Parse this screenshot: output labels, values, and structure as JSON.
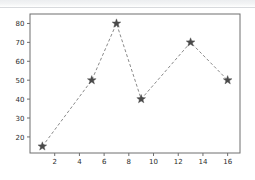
{
  "figure": {
    "background_color": "#ffffff",
    "top_band_color": "#eceef0",
    "axes_frame_color": "#6e6e6e",
    "title": "",
    "caption": ""
  },
  "chart_data": {
    "type": "line",
    "title": "",
    "subtitle": "",
    "xlabel": "",
    "ylabel": "",
    "x": [
      1,
      5,
      7,
      9,
      13,
      16
    ],
    "values": [
      15,
      50,
      80,
      40,
      70,
      50
    ],
    "points": [
      {
        "x": 1,
        "y": 15
      },
      {
        "x": 5,
        "y": 50
      },
      {
        "x": 7,
        "y": 80
      },
      {
        "x": 9,
        "y": 40
      },
      {
        "x": 13,
        "y": 70
      },
      {
        "x": 16,
        "y": 50
      }
    ],
    "series": [
      {
        "name": "series-1",
        "x": [
          1,
          5,
          7,
          9,
          13,
          16
        ],
        "values": [
          15,
          50,
          80,
          40,
          70,
          50
        ],
        "line_style": "dashed",
        "line_color": "#8a8a8a",
        "marker": "star",
        "marker_color": "#4a4a4a",
        "marker_size": 8
      }
    ],
    "xlim": [
      0,
      17
    ],
    "ylim": [
      11.5,
      85
    ],
    "xticks": [
      2,
      4,
      6,
      8,
      10,
      12,
      14,
      16
    ],
    "xtick_labels": [
      "2",
      "4",
      "6",
      "8",
      "10",
      "12",
      "14",
      "16"
    ],
    "yticks": [
      20,
      30,
      40,
      50,
      60,
      70,
      80
    ],
    "ytick_labels": [
      "20",
      "30",
      "40",
      "50",
      "60",
      "70",
      "80"
    ],
    "grid": false,
    "legend": null,
    "legend_position": "none",
    "annotations": []
  }
}
